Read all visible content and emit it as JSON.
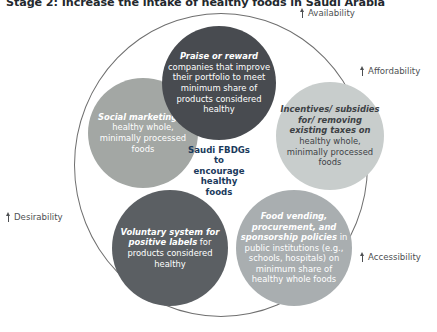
{
  "figure": {
    "title": "Stage 2: Increase the intake of healthy foods in Saudi Arabia",
    "type": "venn-diagram"
  },
  "hub": {
    "label": "Saudi FBDGs to encourage healthy foods"
  },
  "bubbles": {
    "top": {
      "lead": "Praise or reward",
      "rest": " companies that improve their portfolio to meet minimum share of products considered healthy",
      "color": "#484b50"
    },
    "left": {
      "lead": "Social marketing",
      "rest": " of healthy whole, minimally processed foods",
      "color": "#a3a7a4"
    },
    "right": {
      "lead": "Incentives/ subsidies for/ removing existing taxes on",
      "rest": " healthy whole, minimally processed foods",
      "color": "#c8cdcc"
    },
    "bottom_left": {
      "lead": "Voluntary system for positive labels",
      "rest": " for products considered healthy",
      "color": "#5b5f63"
    },
    "bottom_right": {
      "lead": "Food vending, procurement, and sponsorship policies",
      "rest": " in public institutions (e.g., schools, hospitals) on minimum share of healthy whole foods",
      "color": "#a9aeb0"
    }
  },
  "dimensions": [
    {
      "label": "Availability",
      "icon": "up-arrow-icon"
    },
    {
      "label": "Affordability",
      "icon": "up-arrow-icon"
    },
    {
      "label": "Desirability",
      "icon": "up-arrow-icon"
    },
    {
      "label": "Accessibility",
      "icon": "up-arrow-icon"
    }
  ],
  "chart_data": {
    "type": "diagram",
    "title": "Stage 2: Increase the intake of healthy foods in Saudi Arabia",
    "center": "Saudi FBDGs to encourage healthy foods",
    "nodes": [
      "Praise or reward companies that improve their portfolio to meet minimum share of products considered healthy",
      "Social marketing of healthy whole, minimally processed foods",
      "Incentives/ subsidies for/ removing existing taxes on healthy whole, minimally processed foods",
      "Voluntary system for positive labels for products considered healthy",
      "Food vending, procurement, and sponsorship policies in public institutions (e.g., schools, hospitals) on minimum share of healthy whole foods"
    ],
    "outer_labels": [
      "Availability",
      "Affordability",
      "Accessibility",
      "Desirability"
    ]
  }
}
